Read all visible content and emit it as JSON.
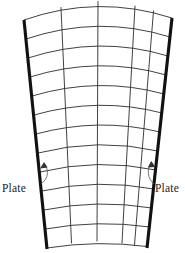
{
  "figure": {
    "type": "engineering-diagram",
    "width": 185,
    "height": 253,
    "background_color": "#ffffff"
  },
  "labels": {
    "left": {
      "text": "Plate",
      "x": 2,
      "y": 192,
      "anchor": "start"
    },
    "right": {
      "text": "Plate",
      "x": 155,
      "y": 192,
      "anchor": "start"
    }
  },
  "leaders": {
    "left": {
      "name": "left-leader-arrow",
      "path": "M 41 184 C 49 178 49 170 44 163",
      "tip": "44,163",
      "color": "#555555"
    },
    "right": {
      "name": "right-leader-arrow",
      "path": "M 154 184 C 147 178 147 170 151 162",
      "tip": "151,162",
      "color": "#555555"
    }
  },
  "geometry": {
    "description": "Annular sector (fan) shaped plate discretised into a structured curved mesh",
    "rows": 12,
    "columns": 5,
    "arc_count": 13,
    "radial_line_count": 6,
    "top_span": {
      "x_left": 24,
      "x_right": 172,
      "y_edge": 20,
      "y_peak": 4
    },
    "bottom_span": {
      "x_left": 47,
      "x_right": 147,
      "y_edge": 248,
      "y_peak": 236
    },
    "mesh_stroke_color": "#2b2b2b",
    "plate_stroke_color": "#111111",
    "plate_stroke_width": 3.1,
    "mesh_stroke_width": 0.9
  },
  "mesh": {
    "arcs": [
      {
        "index": 0,
        "d": "M 24.0 20.0 Q 98.0 -6.0 172.0 18.0"
      },
      {
        "index": 1,
        "d": "M 26.0 39.0 Q 98.5 14.5 170.0 37.0"
      },
      {
        "index": 2,
        "d": "M 28.0 58.0 Q 99.0 35.0 168.0 56.0"
      },
      {
        "index": 3,
        "d": "M 30.0 77.0 Q 99.0 55.5 166.0 75.0"
      },
      {
        "index": 4,
        "d": "M 32.0 96.0 Q 99.0 76.0 164.0 94.0"
      },
      {
        "index": 5,
        "d": "M 34.0 115.0 Q 99.0 96.5 162.0 113.0"
      },
      {
        "index": 6,
        "d": "M 36.0 134.0 Q 99.0 117.0 160.0 132.0"
      },
      {
        "index": 7,
        "d": "M 38.0 153.0 Q 98.5 137.5 158.0 151.0"
      },
      {
        "index": 8,
        "d": "M 40.0 172.0 Q 98.0 158.0 156.0 170.0"
      },
      {
        "index": 9,
        "d": "M 42.0 191.0 Q 97.5 178.5 154.0 189.0"
      },
      {
        "index": 10,
        "d": "M 44.0 210.0 Q 97.0 199.0 152.0 208.0"
      },
      {
        "index": 11,
        "d": "M 45.5 229.0 Q 97.0 219.5 150.0 227.0"
      },
      {
        "index": 12,
        "d": "M 47.0 248.0 Q 97.0 240.0 147.0 246.5"
      }
    ],
    "radials": [
      {
        "index": 0,
        "name": "left-plate-edge",
        "d": "M 24.0 20.0 L 47.0 249.0",
        "is_plate": true
      },
      {
        "index": 1,
        "d": "M 61.0 7.5  L 71.5 243.0",
        "is_plate": false
      },
      {
        "index": 2,
        "d": "M 98.0 1.5  L 97.0 241.0",
        "is_plate": false
      },
      {
        "index": 3,
        "d": "M 135.0 6.0 L 122.0 243.0",
        "is_plate": false
      },
      {
        "index": 4,
        "d": "M 153.5 11.0 L 134.5 245.0",
        "is_plate": false
      },
      {
        "index": 5,
        "name": "right-plate-edge",
        "d": "M 172.0 18.0 L 147.0 248.0",
        "is_plate": true
      }
    ]
  }
}
